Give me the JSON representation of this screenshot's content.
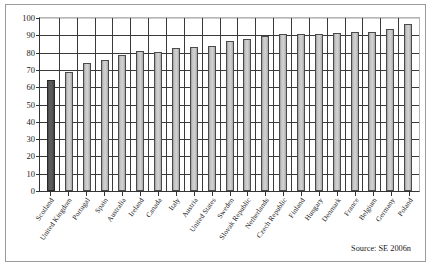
{
  "chart_data": {
    "type": "bar",
    "title": "",
    "subtitle": "",
    "xlabel": "",
    "ylabel": "",
    "ylim": [
      0,
      100
    ],
    "ytick_step": 10,
    "yticks": [
      100,
      90,
      80,
      70,
      60,
      50,
      40,
      30,
      20,
      10,
      0
    ],
    "grid": true,
    "legend": null,
    "legend_position": "none",
    "categories": [
      "Scotland",
      "United Kingdom",
      "Portugal",
      "Spain",
      "Australia",
      "Ireland",
      "Canada",
      "Italy",
      "Austria",
      "United States",
      "Sweden",
      "Slovak Republic",
      "Netherlands",
      "Czech Republic",
      "Finland",
      "Hungary",
      "Denmark",
      "France",
      "Belgium",
      "Germany",
      "Poland"
    ],
    "values": [
      64,
      69,
      74,
      75.5,
      78.5,
      81,
      80.5,
      82.5,
      83.5,
      84,
      87,
      88,
      89.5,
      90.5,
      90.5,
      91,
      91.5,
      91.8,
      92,
      93.5,
      96.5
    ],
    "highlight_index": 0,
    "highlight_category": "Scotland",
    "bar_color": "#c9c9c9",
    "highlight_color": "#525252",
    "bar_edge_color": "#4a4a4a",
    "annotations": [
      "Source: SE 2006n"
    ]
  },
  "source_note": "Source: SE 2006n"
}
